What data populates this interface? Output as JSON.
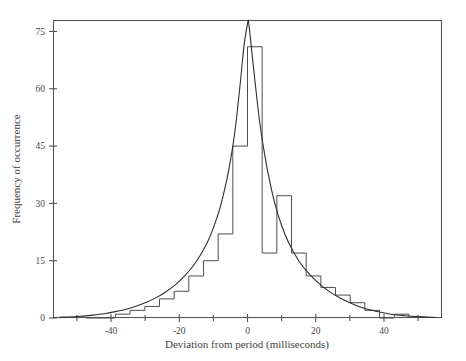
{
  "chart_data": {
    "type": "bar",
    "title": "",
    "subtitle": "",
    "xlabel": "Deviation from period (milliseconds)",
    "ylabel": "Frequency of occurrence",
    "xlim": [
      -57,
      57
    ],
    "ylim": [
      0,
      78
    ],
    "grid": false,
    "legend": null,
    "x_major_ticks": [
      -40,
      -20,
      0,
      20,
      40
    ],
    "x_major_tick_labels": [
      "-40",
      "-20",
      "0",
      "20",
      "40"
    ],
    "x_minor_ticks": [
      -50,
      -30,
      -10,
      10,
      30,
      50
    ],
    "y_major_ticks": [
      0,
      15,
      30,
      45,
      60,
      75
    ],
    "y_major_tick_labels": [
      "0",
      "15",
      "30",
      "45",
      "60",
      "75"
    ],
    "bin_width": 4.3,
    "bin_left_edges": [
      -47.3,
      -43.0,
      -38.7,
      -34.4,
      -30.1,
      -25.8,
      -21.5,
      -17.2,
      -12.9,
      -8.6,
      -4.3,
      0.0,
      4.3,
      8.6,
      12.9,
      17.2,
      21.5,
      25.8,
      30.1,
      34.4,
      38.7,
      43.0
    ],
    "values": [
      0,
      0,
      1,
      2,
      3,
      5,
      7,
      11,
      15,
      22,
      45,
      71,
      17,
      32,
      17,
      11,
      8,
      6,
      4,
      2,
      0,
      1
    ],
    "categories": [
      "-47.3",
      "-43.0",
      "-38.7",
      "-34.4",
      "-30.1",
      "-25.8",
      "-21.5",
      "-17.2",
      "-12.9",
      "-8.6",
      "-4.3",
      "0.0",
      "4.3",
      "8.6",
      "12.9",
      "17.2",
      "21.5",
      "25.8",
      "30.1",
      "34.4",
      "38.7",
      "43.0"
    ],
    "overlay_curve": {
      "name": "fitted distribution",
      "peak_value": 77.5,
      "peak_x": 0.3,
      "x": [
        -55,
        -50,
        -46,
        -42,
        -38,
        -34,
        -30,
        -27,
        -24,
        -21,
        -18,
        -15,
        -12,
        -10,
        -8,
        -6,
        -5,
        -4,
        -3,
        -2,
        -1,
        0,
        0.3,
        1,
        2,
        3,
        4,
        5,
        6,
        8,
        10,
        12,
        15,
        18,
        21,
        24,
        27,
        30,
        34,
        38,
        42,
        46,
        50,
        55
      ],
      "y": [
        0.2,
        0.4,
        0.7,
        1.1,
        1.8,
        2.7,
        4.0,
        5.2,
        6.8,
        8.8,
        11.4,
        14.8,
        19.4,
        23.6,
        29.0,
        36.5,
        41.2,
        46.8,
        54.0,
        62.5,
        71.5,
        77.0,
        77.5,
        72.0,
        63.5,
        55.5,
        48.5,
        43.0,
        38.0,
        30.0,
        24.2,
        19.8,
        15.0,
        11.6,
        9.0,
        6.9,
        5.3,
        4.0,
        2.6,
        1.7,
        1.0,
        0.6,
        0.35,
        0.15
      ]
    }
  },
  "figure": {
    "plot_left_px": 53,
    "plot_right_px": 442,
    "plot_top_px": 20,
    "plot_bottom_px": 318
  }
}
